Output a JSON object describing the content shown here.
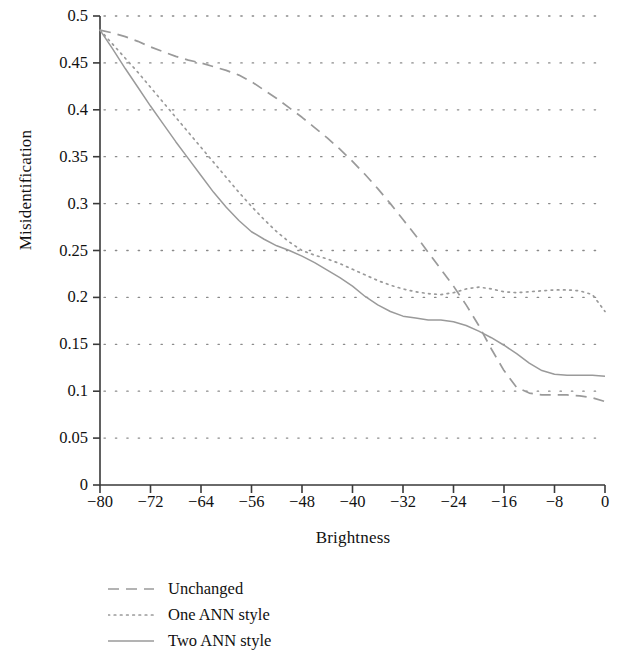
{
  "chart_data": {
    "type": "line",
    "title": "",
    "xlabel": "Brightness",
    "ylabel": "Misidentification",
    "xlim": [
      -80,
      0
    ],
    "ylim": [
      0,
      0.5
    ],
    "xticks": [
      -80,
      -72,
      -64,
      -56,
      -48,
      -40,
      -32,
      -24,
      -16,
      -8,
      0
    ],
    "xtick_labels": [
      "−80",
      "−72",
      "−64",
      "−56",
      "−48",
      "−40",
      "−32",
      "−24",
      "−16",
      "−8",
      "0"
    ],
    "yticks": [
      0,
      0.05,
      0.1,
      0.15,
      0.2,
      0.25,
      0.3,
      0.35,
      0.4,
      0.45,
      0.5
    ],
    "ytick_labels": [
      "0",
      "0.05",
      "0.1",
      "0.15",
      "0.2",
      "0.25",
      "0.3",
      "0.35",
      "0.4",
      "0.45",
      "0.5"
    ],
    "grid": "horizontal-dotted",
    "legend_position": "below-left",
    "line_color": "#9a9a9a",
    "axis_color": "#3a3a3a",
    "grid_color": "#8a8a8a",
    "series": [
      {
        "name": "Unchanged",
        "style": "dashed",
        "x": [
          -80,
          -78,
          -76,
          -74,
          -72,
          -70,
          -68,
          -66,
          -64,
          -62,
          -60,
          -58,
          -56,
          -54,
          -52,
          -50,
          -48,
          -46,
          -44,
          -42,
          -40,
          -38,
          -36,
          -34,
          -32,
          -30,
          -28,
          -26,
          -24,
          -22,
          -20,
          -18,
          -16,
          -14,
          -12,
          -10,
          -8,
          -6,
          -4,
          -2,
          0
        ],
        "y": [
          0.485,
          0.482,
          0.478,
          0.473,
          0.467,
          0.462,
          0.457,
          0.453,
          0.45,
          0.446,
          0.442,
          0.437,
          0.43,
          0.421,
          0.412,
          0.402,
          0.392,
          0.381,
          0.37,
          0.358,
          0.345,
          0.331,
          0.316,
          0.3,
          0.283,
          0.266,
          0.248,
          0.23,
          0.212,
          0.192,
          0.17,
          0.145,
          0.122,
          0.104,
          0.098,
          0.096,
          0.096,
          0.096,
          0.095,
          0.093,
          0.089
        ]
      },
      {
        "name": "One ANN style",
        "style": "dotted",
        "x": [
          -80,
          -78,
          -76,
          -74,
          -72,
          -70,
          -68,
          -66,
          -64,
          -62,
          -60,
          -58,
          -56,
          -54,
          -52,
          -50,
          -48,
          -46,
          -44,
          -42,
          -40,
          -38,
          -36,
          -34,
          -32,
          -30,
          -28,
          -26,
          -24,
          -22,
          -20,
          -18,
          -16,
          -14,
          -12,
          -10,
          -8,
          -6,
          -4,
          -2,
          0
        ],
        "y": [
          0.485,
          0.47,
          0.455,
          0.44,
          0.424,
          0.408,
          0.392,
          0.376,
          0.36,
          0.344,
          0.328,
          0.312,
          0.297,
          0.283,
          0.27,
          0.259,
          0.25,
          0.245,
          0.241,
          0.236,
          0.23,
          0.224,
          0.218,
          0.213,
          0.209,
          0.206,
          0.204,
          0.203,
          0.205,
          0.209,
          0.211,
          0.209,
          0.206,
          0.205,
          0.206,
          0.207,
          0.208,
          0.208,
          0.207,
          0.203,
          0.185
        ]
      },
      {
        "name": "Two ANN style",
        "style": "solid",
        "x": [
          -80,
          -78,
          -76,
          -74,
          -72,
          -70,
          -68,
          -66,
          -64,
          -62,
          -60,
          -58,
          -56,
          -54,
          -52,
          -50,
          -48,
          -46,
          -44,
          -42,
          -40,
          -38,
          -36,
          -34,
          -32,
          -30,
          -28,
          -26,
          -24,
          -22,
          -20,
          -18,
          -16,
          -14,
          -12,
          -10,
          -8,
          -6,
          -4,
          -2,
          0
        ],
        "y": [
          0.485,
          0.465,
          0.444,
          0.424,
          0.404,
          0.385,
          0.366,
          0.348,
          0.33,
          0.312,
          0.296,
          0.282,
          0.27,
          0.262,
          0.255,
          0.25,
          0.244,
          0.237,
          0.229,
          0.221,
          0.212,
          0.201,
          0.192,
          0.185,
          0.18,
          0.178,
          0.176,
          0.176,
          0.174,
          0.17,
          0.164,
          0.157,
          0.149,
          0.14,
          0.13,
          0.122,
          0.118,
          0.117,
          0.117,
          0.117,
          0.116
        ]
      }
    ]
  },
  "legend": {
    "items": [
      {
        "label": "Unchanged",
        "style": "dashed"
      },
      {
        "label": "One ANN style",
        "style": "dotted"
      },
      {
        "label": "Two ANN style",
        "style": "solid"
      }
    ]
  }
}
